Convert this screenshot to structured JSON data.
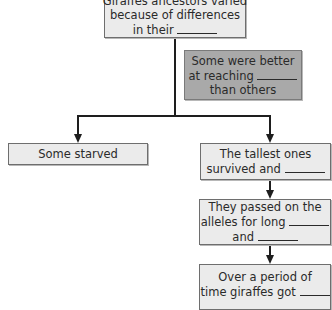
{
  "diagram": {
    "nodes": {
      "ancestors": {
        "lines": [
          "Giraffes ancestors varied",
          "because of differences",
          "in their"
        ],
        "blank_after_line": 3
      },
      "reaching": {
        "lines": [
          "Some were better",
          "at reaching",
          "than others"
        ],
        "blank_after_line": 2,
        "style": "dark"
      },
      "starved": {
        "lines": [
          "Some starved"
        ]
      },
      "tallest": {
        "lines": [
          "The tallest ones",
          "survived and"
        ],
        "blank_after_line": 2
      },
      "passed": {
        "lines": [
          "They passed on the",
          "alleles for long",
          "and"
        ],
        "blank_after_lines": [
          2,
          3
        ]
      },
      "over_time": {
        "lines": [
          "Over a period of",
          "time giraffes got"
        ],
        "blank_after_line": 2
      }
    },
    "edges": [
      {
        "from": "ancestors",
        "to": "starved"
      },
      {
        "from": "ancestors",
        "to": "tallest"
      },
      {
        "from": "tallest",
        "to": "passed"
      },
      {
        "from": "passed",
        "to": "over_time"
      }
    ],
    "colors": {
      "box_fill": "#ebebeb",
      "box_fill_dark": "#a9a9a9",
      "border": "#6e6e6e",
      "line": "#1e1e1e"
    }
  }
}
